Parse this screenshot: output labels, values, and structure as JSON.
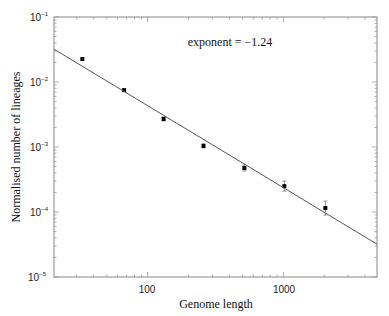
{
  "chart_data": {
    "type": "scatter",
    "title": "",
    "xlabel": "Genome length",
    "ylabel": "Normalised number of lineages",
    "xscale": "log",
    "yscale": "log",
    "xlim": [
      20.4,
      4900
    ],
    "ylim": [
      1e-05,
      0.1
    ],
    "grid": false,
    "legend": null,
    "x_tick_labels": [
      "100",
      "1000"
    ],
    "x_tick_values": [
      100,
      1000
    ],
    "y_tick_labels": [
      {
        "base": "10",
        "exp": "-1"
      },
      {
        "base": "10",
        "exp": "-2"
      },
      {
        "base": "10",
        "exp": "-3"
      },
      {
        "base": "10",
        "exp": "-4"
      },
      {
        "base": "10",
        "exp": "-5"
      }
    ],
    "y_tick_values": [
      0.1,
      0.01,
      0.001,
      0.0001,
      1e-05
    ],
    "annotation": "exponent = −1.24",
    "series": [
      {
        "name": "data",
        "marker": "square",
        "x": [
          33,
          67,
          131,
          258,
          516,
          1017,
          2040
        ],
        "y": [
          0.0226,
          0.0075,
          0.0027,
          0.00104,
          0.000475,
          0.00025,
          0.000115
        ],
        "yerr_log_px": [
          0,
          0,
          2,
          2,
          3,
          5,
          7
        ]
      },
      {
        "name": "power-law fit",
        "type": "line",
        "exponent": -1.24,
        "x": [
          20.4,
          4900
        ],
        "y": [
          0.032,
          3.2e-05
        ]
      }
    ]
  },
  "labels": {
    "xlabel": "Genome length",
    "ylabel": "Normalised number of lineages",
    "annotation": "exponent = −1.24",
    "xticks": [
      "100",
      "1000"
    ],
    "yticks_base": [
      "10",
      "10",
      "10",
      "10",
      "10"
    ],
    "yticks_exp": [
      "−1",
      "−2",
      "−3",
      "−4",
      "−5"
    ]
  }
}
